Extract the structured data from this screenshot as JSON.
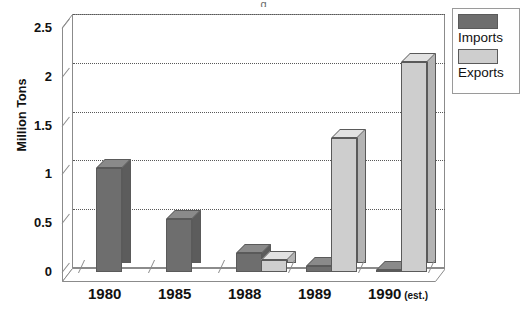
{
  "title_sliver": "g",
  "chart_data": {
    "type": "bar",
    "title": "",
    "xlabel": "",
    "ylabel": "Million Tons",
    "categories": [
      "1980",
      "1985",
      "1988",
      "1989",
      "1990"
    ],
    "category_suffixes": [
      "",
      "",
      "",
      "",
      " (est.)"
    ],
    "ylim": [
      0,
      2.5
    ],
    "yticks": [
      0,
      0.5,
      1,
      1.5,
      2,
      2.5
    ],
    "ytick_labels": [
      "0",
      "0.5",
      "1",
      "1.5",
      "2",
      "2.5"
    ],
    "grid": true,
    "legend_position": "top-right",
    "series": [
      {
        "name": "Imports",
        "color": "#6e6e6e",
        "values": [
          1.07,
          0.54,
          0.19,
          0.06,
          0.02
        ]
      },
      {
        "name": "Exports",
        "color": "#cecece",
        "values": [
          0.0,
          0.0,
          0.12,
          1.37,
          2.15
        ]
      }
    ]
  },
  "legend": {
    "items": [
      {
        "label": "Imports",
        "color": "#6e6e6e"
      },
      {
        "label": "Exports",
        "color": "#cecece"
      }
    ]
  },
  "colors": {
    "imports": "#6e6e6e",
    "imports_side": "#5c5c5c",
    "imports_top": "#8a8a8a",
    "exports": "#cecece",
    "exports_side": "#b4b4b4",
    "exports_top": "#e2e2e2",
    "axis": "#8b8b8b",
    "grid": "#585858",
    "text": "#111111",
    "background": "#ffffff"
  }
}
